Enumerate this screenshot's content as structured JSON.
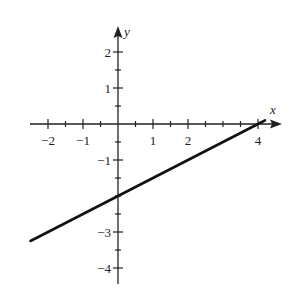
{
  "chart_data": {
    "type": "line",
    "title": "",
    "xlabel": "x",
    "ylabel": "y",
    "xlim": [
      -2.5,
      4.5
    ],
    "ylim": [
      -4.5,
      2.6
    ],
    "x_tick_labels": [
      "−2",
      "−1",
      "1",
      "2",
      "4"
    ],
    "x_tick_values": [
      -2,
      -1,
      1,
      2,
      4
    ],
    "x_minor_ticks": [
      -1.5,
      -0.5,
      0.5,
      1.5,
      2.5,
      3,
      3.5
    ],
    "y_tick_labels": [
      "2",
      "1",
      "−1",
      "−3",
      "−4"
    ],
    "y_tick_values": [
      2,
      1,
      -1,
      -3,
      -4
    ],
    "y_minor_ticks": [
      1.5,
      0.5,
      -0.5,
      -1.5,
      -2,
      -2.5,
      -3.5
    ],
    "grid": false,
    "legend": null,
    "series": [
      {
        "name": "line",
        "equation": "y = 0.5x - 2",
        "x": [
          -2.5,
          0,
          4,
          4.2
        ],
        "y": [
          -3.25,
          -2,
          0,
          0.1
        ]
      }
    ]
  }
}
